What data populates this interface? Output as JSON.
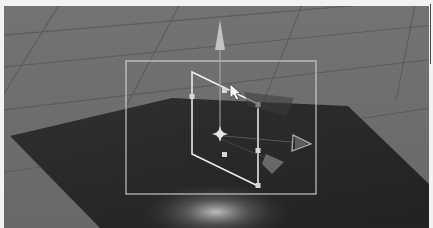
{
  "app": {
    "name": "3d-editor-viewport",
    "title": "Scene View",
    "width": 433,
    "height": 228
  },
  "viewport": {
    "background_color": "#6d6d6d",
    "frame_color": "#f2f2f2",
    "grid_color": "#5a5a5a",
    "grid_visible": true,
    "shading_mode": "Shaded"
  },
  "scene": {
    "objects": [
      {
        "name": "ground-plane",
        "type": "plane",
        "fill_color": "#2b2b2b",
        "selected": false
      },
      {
        "name": "quad-object",
        "type": "quad",
        "outline_color": "#f0f0f0",
        "selected": true,
        "handle_color": "#dcdcdc",
        "handle_count": 4
      }
    ],
    "light": {
      "name": "spot-highlight",
      "color": "#b9b9b9",
      "visible": true
    }
  },
  "selection": {
    "bounds_box_visible": true,
    "bounds_color": "#d8d8d8",
    "bounds_rect": {
      "x": 122,
      "y": 55,
      "w": 190,
      "h": 133
    }
  },
  "gizmo": {
    "type": "translate",
    "center": {
      "x": 216,
      "y": 128
    },
    "axes": [
      {
        "name": "axis-y-arrow",
        "label": "Y",
        "color": "#c8c8c8",
        "direction": "up"
      },
      {
        "name": "axis-x-arrow",
        "label": "X",
        "color": "#8a8a8a",
        "direction": "right"
      },
      {
        "name": "axis-z-arrow",
        "label": "Z",
        "color": "#9a9a9a",
        "direction": "front-left"
      }
    ],
    "center_handle": {
      "name": "gizmo-center-handle",
      "color": "#ededed"
    }
  },
  "cursor": {
    "type": "arrow-pointer",
    "x": 228,
    "y": 86,
    "color": "#ffffff"
  }
}
